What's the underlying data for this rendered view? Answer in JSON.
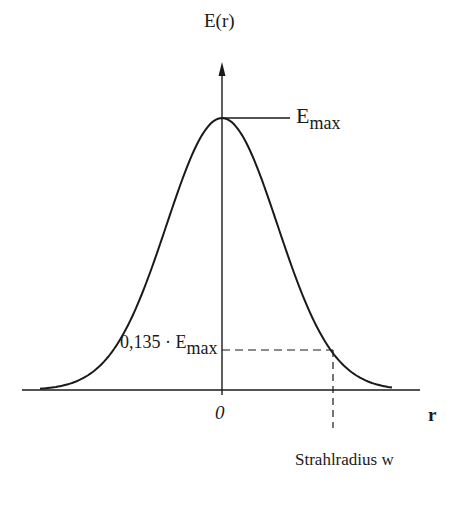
{
  "figure": {
    "y_axis_label": "E(r)",
    "x_axis_label": "r",
    "origin_label": "0",
    "peak_label": {
      "base": "E",
      "sub": "max"
    },
    "threshold_label": {
      "prefix": "0,135 · E",
      "sub": "max"
    },
    "beam_radius_label": "Strahlradius  w"
  },
  "chart_data": {
    "type": "line",
    "title": "",
    "xlabel": "r",
    "ylabel": "E(r)",
    "series": [
      {
        "name": "E(r) = Emax · exp(-2r²/w²)",
        "shape": "gaussian",
        "center": 0,
        "peak": "Emax"
      }
    ],
    "annotations": [
      {
        "text": "Emax",
        "at": "peak (r=0)"
      },
      {
        "text": "0,135 · Emax",
        "at": "r = w (1/e² level)"
      },
      {
        "text": "Strahlradius w",
        "at": "x position of 1/e² crossing"
      },
      {
        "text": "0",
        "at": "origin"
      }
    ],
    "grid": false,
    "legend": "none"
  },
  "style": {
    "ink": "#1a1a1a",
    "background": "#ffffff"
  }
}
